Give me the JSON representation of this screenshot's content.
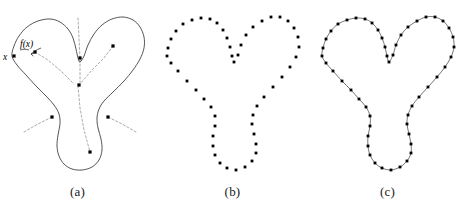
{
  "figure": {
    "background_color": "#ffffff",
    "ink_color": "#000000",
    "outline_color": "#2b2b2b",
    "skeleton_color": "#8e8e8e",
    "point_color": "#000000",
    "panel_count": 3
  },
  "panels": [
    {
      "id": "a",
      "caption": "(a)",
      "description": "Continuous closed trefoil/Y-shaped curve with dashed medial skeleton, interior sample dots, and labels x and f(x)",
      "labels": [
        {
          "name": "x-label",
          "text": "x"
        },
        {
          "name": "fx-label",
          "text": "f(x)"
        }
      ],
      "shape_points": [
        [
          12,
          56
        ],
        [
          14,
          46
        ],
        [
          19,
          36
        ],
        [
          27,
          27
        ],
        [
          38,
          21
        ],
        [
          50,
          19
        ],
        [
          60,
          22
        ],
        [
          68,
          29
        ],
        [
          73,
          38
        ],
        [
          76,
          49
        ],
        [
          78,
          58
        ],
        [
          80,
          62
        ],
        [
          84,
          56
        ],
        [
          88,
          45
        ],
        [
          94,
          34
        ],
        [
          102,
          25
        ],
        [
          112,
          19
        ],
        [
          123,
          17
        ],
        [
          133,
          20
        ],
        [
          140,
          27
        ],
        [
          144,
          37
        ],
        [
          144,
          48
        ],
        [
          140,
          59
        ],
        [
          133,
          70
        ],
        [
          124,
          81
        ],
        [
          113,
          92
        ],
        [
          104,
          101
        ],
        [
          99,
          109
        ],
        [
          97,
          118
        ],
        [
          98,
          128
        ],
        [
          101,
          139
        ],
        [
          102,
          150
        ],
        [
          99,
          160
        ],
        [
          92,
          167
        ],
        [
          82,
          170
        ],
        [
          72,
          169
        ],
        [
          64,
          164
        ],
        [
          59,
          156
        ],
        [
          57,
          146
        ],
        [
          58,
          135
        ],
        [
          60,
          124
        ],
        [
          59,
          114
        ],
        [
          54,
          105
        ],
        [
          46,
          96
        ],
        [
          36,
          86
        ],
        [
          26,
          75
        ],
        [
          17,
          65
        ]
      ],
      "skeleton_branches": [
        {
          "name": "upper-left-branch",
          "path": [
            [
              35,
              52
            ],
            [
              48,
              60
            ],
            [
              62,
              72
            ],
            [
              74,
              84
            ]
          ]
        },
        {
          "name": "upper-right-branch",
          "path": [
            [
              113,
              46
            ],
            [
              104,
              58
            ],
            [
              92,
              70
            ],
            [
              80,
              84
            ]
          ]
        },
        {
          "name": "center-vertical-branch",
          "path": [
            [
              78,
              18
            ],
            [
              79,
              38
            ],
            [
              80,
              58
            ],
            [
              80,
              82
            ]
          ]
        },
        {
          "name": "lower-branch",
          "path": [
            [
              78,
              86
            ],
            [
              80,
              108
            ],
            [
              84,
              130
            ],
            [
              90,
              152
            ]
          ]
        },
        {
          "name": "left-lower-branch",
          "path": [
            [
              24,
              132
            ],
            [
              38,
              124
            ],
            [
              52,
              117
            ]
          ]
        },
        {
          "name": "right-lower-branch",
          "path": [
            [
              136,
              132
            ],
            [
              122,
              124
            ],
            [
              108,
              117
            ]
          ]
        }
      ],
      "interior_points": [
        {
          "name": "point-upper-left",
          "x": 35,
          "y": 52
        },
        {
          "name": "point-upper-right",
          "x": 113,
          "y": 46
        },
        {
          "name": "point-center-top",
          "x": 80,
          "y": 58
        },
        {
          "name": "point-junction",
          "x": 79,
          "y": 85
        },
        {
          "name": "point-left-lower",
          "x": 52,
          "y": 117
        },
        {
          "name": "point-right-lower",
          "x": 108,
          "y": 117
        },
        {
          "name": "point-bottom",
          "x": 90,
          "y": 152
        },
        {
          "name": "point-x-on-curve",
          "x": 14,
          "y": 56
        }
      ]
    },
    {
      "id": "b",
      "caption": "(b)",
      "description": "The same shape represented only by an unordered set of sample points",
      "sample_points": [
        [
          12,
          56
        ],
        [
          13,
          48
        ],
        [
          16,
          39
        ],
        [
          21,
          31
        ],
        [
          28,
          24
        ],
        [
          37,
          20
        ],
        [
          46,
          18
        ],
        [
          55,
          19
        ],
        [
          62,
          23
        ],
        [
          68,
          30
        ],
        [
          72,
          38
        ],
        [
          75,
          47
        ],
        [
          77,
          56
        ],
        [
          79,
          62
        ],
        [
          83,
          55
        ],
        [
          86,
          45
        ],
        [
          91,
          35
        ],
        [
          98,
          27
        ],
        [
          107,
          21
        ],
        [
          116,
          17
        ],
        [
          125,
          17
        ],
        [
          133,
          21
        ],
        [
          139,
          28
        ],
        [
          143,
          37
        ],
        [
          144,
          47
        ],
        [
          141,
          57
        ],
        [
          135,
          67
        ],
        [
          127,
          77
        ],
        [
          118,
          87
        ],
        [
          109,
          97
        ],
        [
          102,
          106
        ],
        [
          98,
          115
        ],
        [
          97,
          124
        ],
        [
          99,
          134
        ],
        [
          101,
          144
        ],
        [
          101,
          153
        ],
        [
          97,
          161
        ],
        [
          90,
          167
        ],
        [
          81,
          170
        ],
        [
          72,
          168
        ],
        [
          65,
          163
        ],
        [
          60,
          155
        ],
        [
          58,
          146
        ],
        [
          58,
          136
        ],
        [
          60,
          126
        ],
        [
          60,
          116
        ],
        [
          56,
          107
        ],
        [
          49,
          99
        ],
        [
          41,
          90
        ],
        [
          32,
          81
        ],
        [
          23,
          71
        ],
        [
          16,
          63
        ]
      ]
    },
    {
      "id": "c",
      "caption": "(c)",
      "description": "The sample points reconnected by a reconstructed piecewise-smooth closed curve",
      "sample_points": [
        [
          12,
          56
        ],
        [
          13,
          48
        ],
        [
          16,
          39
        ],
        [
          21,
          31
        ],
        [
          28,
          24
        ],
        [
          37,
          20
        ],
        [
          46,
          18
        ],
        [
          55,
          19
        ],
        [
          62,
          23
        ],
        [
          68,
          30
        ],
        [
          72,
          38
        ],
        [
          75,
          47
        ],
        [
          77,
          56
        ],
        [
          79,
          62
        ],
        [
          83,
          55
        ],
        [
          86,
          45
        ],
        [
          91,
          35
        ],
        [
          98,
          27
        ],
        [
          107,
          21
        ],
        [
          116,
          17
        ],
        [
          125,
          17
        ],
        [
          133,
          21
        ],
        [
          139,
          28
        ],
        [
          143,
          37
        ],
        [
          144,
          47
        ],
        [
          141,
          57
        ],
        [
          135,
          67
        ],
        [
          127,
          77
        ],
        [
          118,
          87
        ],
        [
          109,
          97
        ],
        [
          102,
          106
        ],
        [
          98,
          115
        ],
        [
          97,
          124
        ],
        [
          99,
          134
        ],
        [
          101,
          144
        ],
        [
          101,
          153
        ],
        [
          97,
          161
        ],
        [
          90,
          167
        ],
        [
          81,
          170
        ],
        [
          72,
          168
        ],
        [
          65,
          163
        ],
        [
          60,
          155
        ],
        [
          58,
          146
        ],
        [
          58,
          136
        ],
        [
          60,
          126
        ],
        [
          60,
          116
        ],
        [
          56,
          107
        ],
        [
          49,
          99
        ],
        [
          41,
          90
        ],
        [
          32,
          81
        ],
        [
          23,
          71
        ],
        [
          16,
          63
        ]
      ]
    }
  ]
}
